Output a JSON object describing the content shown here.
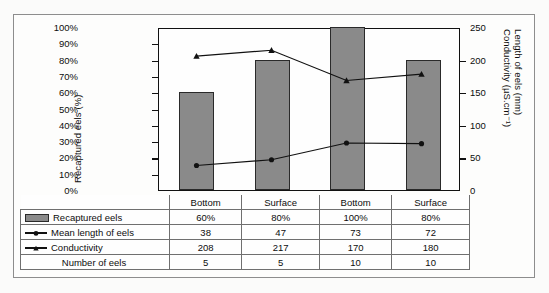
{
  "chart_data": {
    "type": "bar",
    "title": "",
    "xlabel": "",
    "categories": [
      "Bottom",
      "Surface",
      "Bottom",
      "Surface"
    ],
    "grid": false,
    "legend_position": "table-below",
    "axes": {
      "left": {
        "label": "Recaptured eels (%)",
        "ticks": [
          "0%",
          "10%",
          "20%",
          "30%",
          "40%",
          "50%",
          "60%",
          "70%",
          "80%",
          "90%",
          "100%"
        ],
        "min": 0,
        "max": 100
      },
      "right": {
        "label_line1": "Conductivity (µS.cm⁻¹)",
        "label_line2": "Length of eels (mm)",
        "ticks": [
          "0",
          "50",
          "100",
          "150",
          "200",
          "250"
        ],
        "min": 0,
        "max": 250
      }
    },
    "series": [
      {
        "name": "Recaptured eels",
        "type": "bar",
        "axis": "left",
        "values": [
          60,
          80,
          100,
          80
        ],
        "labels": [
          "60%",
          "80%",
          "100%",
          "80%"
        ]
      },
      {
        "name": "Mean length of eels",
        "type": "line",
        "marker": "circle",
        "axis": "right",
        "values": [
          38,
          47,
          73,
          72
        ],
        "labels": [
          "38",
          "47",
          "73",
          "72"
        ]
      },
      {
        "name": "Conductivity",
        "type": "line",
        "marker": "triangle",
        "axis": "right",
        "values": [
          208,
          217,
          170,
          180
        ],
        "labels": [
          "208",
          "217",
          "170",
          "180"
        ]
      },
      {
        "name": "Number of eels",
        "type": "table-only",
        "values": [
          5,
          5,
          10,
          10
        ],
        "labels": [
          "5",
          "5",
          "10",
          "10"
        ]
      }
    ]
  },
  "table": {
    "header_row": [
      "Bottom",
      "Surface",
      "Bottom",
      "Surface"
    ],
    "rows": [
      {
        "legend": "Recaptured eels",
        "marker": "bar-swatch",
        "values": [
          "60%",
          "80%",
          "100%",
          "80%"
        ]
      },
      {
        "legend": "Mean length of eels",
        "marker": "line-circle",
        "values": [
          "38",
          "47",
          "73",
          "72"
        ]
      },
      {
        "legend": "Conductivity",
        "marker": "line-triangle",
        "values": [
          "208",
          "217",
          "170",
          "180"
        ]
      },
      {
        "legend": "Number of eels",
        "marker": "none",
        "values": [
          "5",
          "5",
          "10",
          "10"
        ]
      }
    ]
  },
  "colors": {
    "bar_fill": "#8a8a8a",
    "bar_stroke": "#2a2a2a",
    "line": "#111111",
    "frame": "#111111",
    "outer_border": "#8d8d8d",
    "page_background": "#fbfbfa"
  }
}
